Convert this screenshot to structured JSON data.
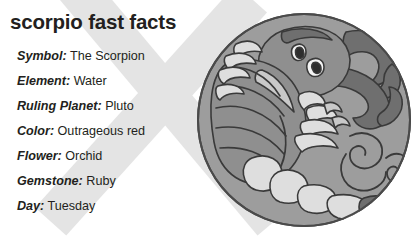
{
  "page": {
    "title": "scorpio fast facts",
    "background_color": "#ffffff",
    "text_color": "#231f20"
  },
  "facts": [
    {
      "label": "Symbol:",
      "value": "The Scorpion"
    },
    {
      "label": "Element:",
      "value": "Water"
    },
    {
      "label": "Ruling Planet:",
      "value": "Pluto"
    },
    {
      "label": "Color:",
      "value": "Outrageous red"
    },
    {
      "label": "Flower:",
      "value": "Orchid"
    },
    {
      "label": "Gemstone:",
      "value": "Ruby"
    },
    {
      "label": "Day:",
      "value": "Tuesday"
    }
  ],
  "illustration": {
    "name": "scorpio-scorpion-medallion",
    "shape": "circle",
    "colors": {
      "disc_fill": "#9d9d9d",
      "outline": "#3a3a3a",
      "body_mid": "#8f8f8f",
      "body_dark": "#6f6f6f",
      "body_light": "#c9c9c9",
      "body_lighter": "#dedede",
      "eye_white": "#f4f4f4",
      "watermark": "#e4e4e4"
    }
  }
}
